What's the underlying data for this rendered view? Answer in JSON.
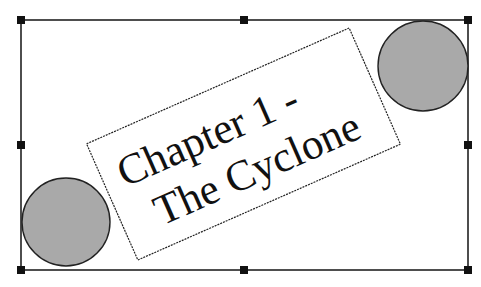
{
  "canvas": {
    "width": 481,
    "height": 287,
    "background": "#ffffff"
  },
  "selection_frame": {
    "x": 21,
    "y": 20,
    "width": 447,
    "height": 250,
    "stroke": "#222222",
    "handles": [
      "top-left",
      "top-middle",
      "top-right",
      "middle-left",
      "middle-right",
      "bottom-left",
      "bottom-middle",
      "bottom-right"
    ]
  },
  "shapes": {
    "circle_left": {
      "cx": 66,
      "cy": 222,
      "r": 44,
      "fill": "#a9a9a9"
    },
    "circle_right": {
      "cx": 423,
      "cy": 66,
      "r": 45,
      "fill": "#a9a9a9"
    }
  },
  "text_box": {
    "rotation_deg": -23.8,
    "center_x": 243.5,
    "center_y": 144,
    "width": 287,
    "height": 127,
    "line1": "Chapter 1 -",
    "line2": "The Cyclone"
  }
}
